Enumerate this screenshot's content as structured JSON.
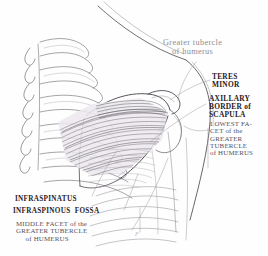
{
  "figure": {
    "signature": "F"
  },
  "labels": {
    "greater_tubercle": "Greater tubercle\nof humerus",
    "teres_minor": "TERES\nMINOR",
    "axillary_border": "AXILLARY\nBORDER of\nSCAPULA",
    "lowest_facet": "LOWEST FA-\nCET of the\nGREATER\nTUBERCLE\nof HUMERUS",
    "infraspinatus": "INFRASPINATUS",
    "infraspinous_fossa": "INFRASPINOUS  FOSSA",
    "middle_facet": "MIDDLE FACET of the\nGREATER TUBERCLE\n     of HUMERUS"
  },
  "colors": {
    "background": "#fefefe",
    "ink_dark": "#282024",
    "ink_mid": "#55505a",
    "ink_light": "#8e8d92",
    "line": "#6f6a73",
    "muscle_shade": "#9a959c"
  }
}
